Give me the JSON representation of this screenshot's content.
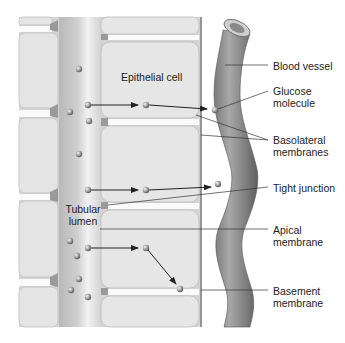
{
  "diagram": {
    "colors": {
      "background": "#ffffff",
      "tissue": "#d9d9d9",
      "cell_fill": "#e6e6e6",
      "cell_border": "#bdbdbd",
      "lumen": "#c6c6c6",
      "lumen_highlight": "#f0f0f0",
      "junction": "#9e9e9e",
      "vessel_dark": "#6e6e6e",
      "vessel_light": "#b0b0b0",
      "molecule": "#9a9a9a",
      "line": "#333333",
      "text": "#222222"
    },
    "inline_labels": {
      "epithelial_cell": "Epithelial cell",
      "tubular_lumen_line1": "Tubular",
      "tubular_lumen_line2": "lumen"
    },
    "callouts": [
      {
        "id": "blood-vessel",
        "lines": [
          "Blood vessel"
        ]
      },
      {
        "id": "glucose-molecule",
        "lines": [
          "Glucose",
          "molecule"
        ]
      },
      {
        "id": "basolateral-membranes",
        "lines": [
          "Basolateral",
          "membranes"
        ]
      },
      {
        "id": "tight-junction",
        "lines": [
          "Tight junction"
        ]
      },
      {
        "id": "apical-membrane",
        "lines": [
          "Apical",
          "membrane"
        ]
      },
      {
        "id": "basement-membrane",
        "lines": [
          "Basement",
          "membrane"
        ]
      }
    ],
    "molecules_count": 18,
    "transport_paths": 3
  }
}
